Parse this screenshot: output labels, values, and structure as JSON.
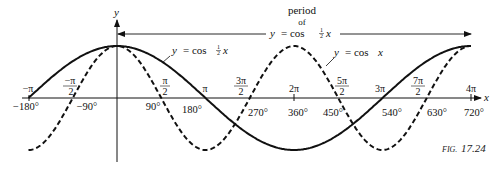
{
  "chart_data": {
    "type": "line",
    "title": "",
    "figure_label": "FIG. 17.24",
    "xlabel": "x",
    "ylabel": "y",
    "xlim_degrees": [
      -180,
      720
    ],
    "ylim": [
      -1,
      1
    ],
    "grid": false,
    "x_tick_labels_radians": [
      "-π",
      "-π/2",
      "π/2",
      "π",
      "3π/2",
      "2π",
      "5π/2",
      "3π",
      "7π/2",
      "4π"
    ],
    "x_tick_labels_degrees": [
      "-180°",
      "-90°",
      "90°",
      "180°",
      "270°",
      "360°",
      "450°",
      "540°",
      "630°",
      "720°"
    ],
    "x_tick_values_degrees": [
      -180,
      -90,
      90,
      180,
      270,
      360,
      450,
      540,
      630,
      720
    ],
    "series": [
      {
        "name": "y = cos ½x",
        "style": "solid",
        "x": [
          -180,
          -90,
          0,
          90,
          180,
          270,
          360,
          450,
          540,
          630,
          720
        ],
        "y": [
          0,
          0.707,
          1,
          0.707,
          0,
          -0.707,
          -1,
          -0.707,
          0,
          0.707,
          1
        ]
      },
      {
        "name": "y = cos x",
        "style": "dashed",
        "x": [
          -180,
          -90,
          0,
          90,
          180,
          270,
          360,
          450,
          540,
          630,
          720
        ],
        "y": [
          -1,
          0,
          1,
          0,
          -1,
          0,
          1,
          0,
          -1,
          0,
          1
        ]
      }
    ],
    "annotations": [
      {
        "text": "period of y = cos ½x",
        "spans_degrees": [
          0,
          720
        ]
      },
      {
        "text": "y = cos ½x",
        "points_to": "solid curve"
      },
      {
        "text": "y = cos x",
        "points_to": "dashed curve"
      }
    ]
  },
  "labels": {
    "y_axis": "y",
    "x_axis": "x",
    "period_line1": "period",
    "period_line2": "of",
    "period_eq_y": "y",
    "period_eq_rest": "= cos",
    "half_num": "1",
    "half_den": "2",
    "period_eq_x": "x",
    "solid_eq_y": "y",
    "solid_eq_rest": "= cos",
    "solid_eq_x": "x",
    "dashed_eq": "y = cos x",
    "dashed_eq_y": "y",
    "dashed_eq_rest": "= cos",
    "dashed_eq_x": "x",
    "fig_prefix": "FIG.",
    "fig_num": "17.24",
    "rad": {
      "neg_pi": "−π",
      "neg_pi_half_num": "−π",
      "pi_half_num": "π",
      "pi": "π",
      "three_pi_half_num": "3π",
      "two_pi": "2π",
      "five_pi_half_num": "5π",
      "three_pi": "3π",
      "seven_pi_half_num": "7π",
      "four_pi": "4π",
      "den": "2"
    },
    "deg": {
      "m180": "−180°",
      "m90": "−90°",
      "d90": "90°",
      "d180": "180°",
      "d270": "270°",
      "d360": "360°",
      "d450": "450°",
      "d540": "540°",
      "d630": "630°",
      "d720": "720°"
    }
  }
}
